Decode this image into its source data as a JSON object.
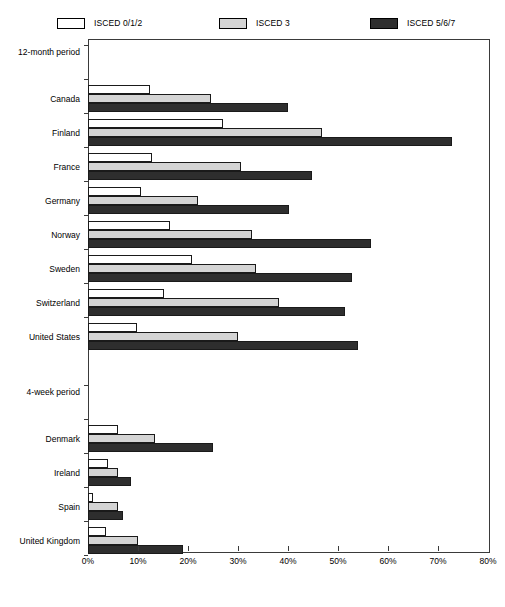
{
  "legend": {
    "items": [
      {
        "label": "ISCED 0/1/2",
        "swatch": "low",
        "color": "#ffffff",
        "x": 57
      },
      {
        "label": "ISCED 3",
        "swatch": "mid",
        "color": "#d4d4d4",
        "x": 219
      },
      {
        "label": "ISCED 5/6/7",
        "swatch": "high",
        "color": "#2e2e2e",
        "x": 370
      }
    ]
  },
  "chart_data": {
    "type": "bar",
    "orientation": "horizontal",
    "title": "",
    "xlabel": "",
    "ylabel": "",
    "xlim": [
      0,
      80
    ],
    "xtick_labels": [
      "0%",
      "10%",
      "20%",
      "30%",
      "40%",
      "50%",
      "60%",
      "70%",
      "80%"
    ],
    "xtick_values": [
      0,
      10,
      20,
      30,
      40,
      50,
      60,
      70,
      80
    ],
    "grid": false,
    "legend_position": "top",
    "series": [
      {
        "name": "ISCED 0/1/2",
        "key": "low",
        "color": "#ffffff"
      },
      {
        "name": "ISCED 3",
        "key": "mid",
        "color": "#d4d4d4"
      },
      {
        "name": "ISCED 5/6/7",
        "key": "high",
        "color": "#2e2e2e"
      }
    ],
    "groups": [
      {
        "name": "12-month period",
        "categories": [
          "Canada",
          "Finland",
          "France",
          "Germany",
          "Norway",
          "Sweden",
          "Switzerland",
          "United States"
        ],
        "values": {
          "low": [
            12.4,
            27.0,
            12.8,
            10.6,
            16.4,
            20.8,
            15.2,
            9.8
          ],
          "mid": [
            24.6,
            46.8,
            30.6,
            22.0,
            32.8,
            33.6,
            38.2,
            30.0
          ],
          "high": [
            40.0,
            72.8,
            44.8,
            40.2,
            56.6,
            52.8,
            51.4,
            54.0
          ]
        }
      },
      {
        "name": "4-week period",
        "categories": [
          "Denmark",
          "Ireland",
          "Spain",
          "United Kingdom"
        ],
        "values": {
          "low": [
            6.0,
            4.0,
            1.0,
            3.6
          ],
          "mid": [
            13.4,
            6.0,
            6.0,
            10.0
          ],
          "high": [
            25.0,
            8.6,
            7.0,
            19.0
          ]
        }
      }
    ]
  }
}
